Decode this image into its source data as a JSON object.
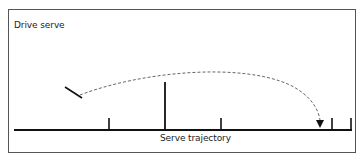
{
  "diagram": {
    "title": "Drive serve",
    "axis_label": "Serve trajectory",
    "colors": {
      "line": "#111111",
      "dashed_path": "#666666",
      "frame": "#555555"
    },
    "baseline": {
      "x1": 14,
      "x2": 352,
      "y": 130
    },
    "ticks": [
      {
        "x": 109,
        "height": 12,
        "kind": "short"
      },
      {
        "x": 165,
        "height": 48,
        "kind": "tall"
      },
      {
        "x": 221,
        "height": 12,
        "kind": "short"
      },
      {
        "x": 332,
        "height": 12,
        "kind": "short"
      },
      {
        "x": 351,
        "height": 12,
        "kind": "short"
      }
    ],
    "racket": {
      "x1": 65,
      "y1": 87,
      "x2": 82,
      "y2": 98
    },
    "trajectory": {
      "start": [
        80,
        95
      ],
      "apex": [
        190,
        70
      ],
      "end": [
        320,
        122
      ],
      "arrow": "arrowhead-down"
    }
  }
}
